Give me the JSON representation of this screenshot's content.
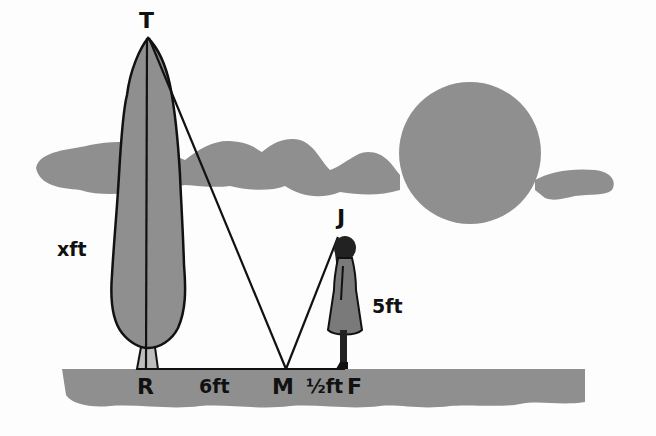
{
  "diagram": {
    "type": "similar-triangles-mirror-problem",
    "points": {
      "T": "T",
      "R": "R",
      "M": "M",
      "F": "F",
      "J": "J"
    },
    "measurements": {
      "tree_height": "xft",
      "R_to_M": "6ft",
      "M_to_F": "½ft",
      "girl_height": "5ft"
    },
    "scene": {
      "objects": [
        "tree",
        "girl",
        "sun",
        "clouds",
        "ground"
      ],
      "colors": {
        "fill_gray": "#8f8f8f",
        "line": "#111111",
        "background": "#fdfdfd"
      }
    }
  }
}
